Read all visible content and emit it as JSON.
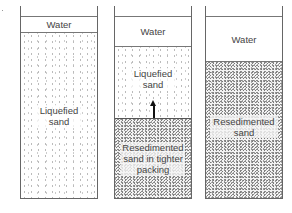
{
  "columns": [
    {
      "id": "left",
      "layers": [
        {
          "type": "water",
          "label": "Water"
        },
        {
          "type": "liquefied-sand",
          "label": "Liquefied sand"
        }
      ]
    },
    {
      "id": "middle",
      "layers": [
        {
          "type": "water",
          "label": "Water"
        },
        {
          "type": "liquefied-sand",
          "label": "Liquefied sand"
        },
        {
          "type": "resedimented-sand",
          "label": "Resedimented sand in tighter packing"
        }
      ],
      "arrow": "upward"
    },
    {
      "id": "right",
      "layers": [
        {
          "type": "water",
          "label": "Water"
        },
        {
          "type": "resedimented-sand",
          "label": "Resedimented sand"
        }
      ]
    }
  ],
  "colors": {
    "outline": "#666666",
    "water": "#ffffff",
    "loose_sand_dots": "#bbbbbb",
    "dense_sand_dots": "#777777",
    "arrow": "#111111"
  }
}
